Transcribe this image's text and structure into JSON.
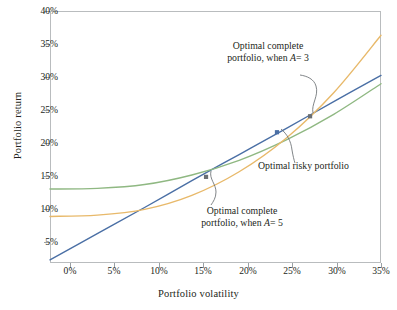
{
  "chart_data": {
    "type": "line",
    "title": "",
    "xlabel": "Portfolio volatility",
    "ylabel": "Portfolio return",
    "xlim": [
      0,
      35
    ],
    "ylim": [
      1.5,
      41
    ],
    "grid": false,
    "legend": "none",
    "xticks": [
      "0%",
      "5%",
      "10%",
      "15%",
      "20%",
      "25%",
      "30%",
      "35%"
    ],
    "xtick_values": [
      0,
      5,
      10,
      15,
      20,
      25,
      30,
      35
    ],
    "yticks": [
      "5%",
      "10%",
      "15%",
      "20%",
      "25%",
      "30%",
      "35%",
      "40%"
    ],
    "ytick_values": [
      5,
      10,
      15,
      20,
      25,
      30,
      35,
      40
    ],
    "series": [
      {
        "name": "Capital allocation line",
        "color": "#4a6fa5",
        "x": [
          0,
          5,
          10,
          15,
          20,
          25,
          30,
          35
        ],
        "values": [
          2.0,
          6.1,
          10.2,
          14.4,
          18.5,
          22.6,
          26.8,
          30.9
        ]
      },
      {
        "name": "Efficient frontier",
        "color": "#8fb882",
        "x": [
          0,
          5,
          10,
          15,
          20,
          25,
          30,
          35
        ],
        "values": [
          13.1,
          13.2,
          13.8,
          15.3,
          17.6,
          20.8,
          24.8,
          29.6
        ]
      },
      {
        "name": "Indifference curve",
        "color": "#e8b96a",
        "x": [
          0,
          5,
          10,
          15,
          20,
          25,
          30,
          35
        ],
        "values": [
          8.8,
          9.0,
          9.9,
          12.1,
          15.8,
          21.1,
          28.2,
          37.2
        ]
      }
    ],
    "points": [
      {
        "name": "Optimal complete portfolio, when A = 5",
        "x": 16.5,
        "y": 15.0,
        "color": "#6a6f73"
      },
      {
        "name": "Optimal risky portfolio",
        "x": 24.0,
        "y": 22.0,
        "color": "#4a6fa5"
      },
      {
        "name": "Optimal complete portfolio, when A = 3",
        "x": 27.5,
        "y": 24.5,
        "color": "#6a6f73"
      }
    ],
    "annotations": [
      {
        "id": "a3",
        "line1": "Optimal complete",
        "line2_pre": "portfolio, when ",
        "line2_italic": "A",
        "line2_post": "= 3"
      },
      {
        "id": "a5",
        "line1": "Optimal complete",
        "line2_pre": "portfolio, when ",
        "line2_italic": "A",
        "line2_post": "= 5"
      },
      {
        "id": "risky",
        "line1": "Optimal risky portfolio"
      }
    ],
    "colors": {
      "cal": "#4a6fa5",
      "frontier": "#8fb882",
      "indifference": "#e8b96a",
      "frame": "#b9bcbe",
      "leader": "#6a6f73",
      "text": "#231f20"
    }
  }
}
